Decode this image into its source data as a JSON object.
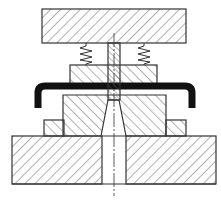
{
  "diagram": {
    "type": "mechanical-cross-section",
    "colors": {
      "background": "#ffffff",
      "line": "#333333",
      "hatch": "#555555",
      "workpiece": "#111111"
    },
    "parts": [
      {
        "id": "top-plate",
        "label": ""
      },
      {
        "id": "spring-left",
        "label": ""
      },
      {
        "id": "spring-right",
        "label": ""
      },
      {
        "id": "punch",
        "label": ""
      },
      {
        "id": "stripper",
        "label": ""
      },
      {
        "id": "workpiece",
        "label": ""
      },
      {
        "id": "die",
        "label": ""
      },
      {
        "id": "die-support-left",
        "label": ""
      },
      {
        "id": "die-support-right",
        "label": ""
      },
      {
        "id": "base-plate",
        "label": ""
      },
      {
        "id": "centerline",
        "label": ""
      }
    ]
  }
}
